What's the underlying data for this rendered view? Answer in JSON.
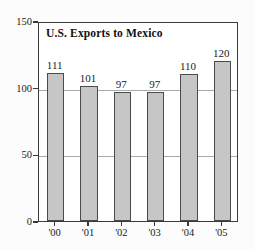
{
  "chart_data": {
    "type": "bar",
    "title": "U.S. Exports to Mexico",
    "xlabel": "",
    "ylabel": "$ billions",
    "categories": [
      "'00",
      "'01",
      "'02",
      "'03",
      "'04",
      "'05"
    ],
    "values": [
      111,
      101,
      97,
      97,
      110,
      120
    ],
    "value_labels": [
      "111",
      "101",
      "97",
      "97",
      "110",
      "120"
    ],
    "ylim": [
      0,
      150
    ],
    "yticks": [
      0,
      50,
      100,
      150
    ],
    "ytick_labels": [
      "0",
      "50",
      "100",
      "150"
    ],
    "gridlines": [
      50,
      100
    ],
    "grid": true,
    "legend": null,
    "colors": {
      "bar_fill": "#c6c6c6",
      "bar_stroke": "#4a4a4a",
      "frame": "#3a3a3a",
      "grid": "#aaaaaa",
      "text": "#1a1a1a",
      "background": "#fcfcfc"
    }
  }
}
